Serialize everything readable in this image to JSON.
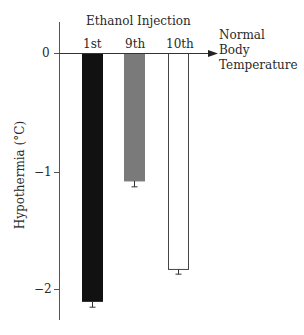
{
  "chart_data": {
    "type": "bar",
    "title": "Ethanol Injection",
    "categories": [
      "1st",
      "9th",
      "10th"
    ],
    "values": [
      -2.1,
      -1.08,
      -1.83
    ],
    "error": [
      0.05,
      0.05,
      0.04
    ],
    "bar_colors": [
      "#111111",
      "#7a7a7a",
      "#ffffff"
    ],
    "xlabel": "",
    "ylabel": "Hypothermia (°C)",
    "ylim": [
      -2.25,
      0.3
    ],
    "yticks": [
      0,
      -1,
      -2
    ],
    "ytick_labels": [
      "0",
      "−1",
      "−2"
    ],
    "grid": false,
    "annotation": [
      "Normal",
      "Body",
      "Temperature"
    ]
  },
  "labels": {
    "title": "Ethanol Injection",
    "ylabel": "Hypothermia (°C)",
    "cat0": "1st",
    "cat1": "9th",
    "cat2": "10th",
    "tick0": "0",
    "tick1": "−1",
    "tick2": "−2",
    "note0": "Normal",
    "note1": "Body",
    "note2": "Temperature"
  }
}
